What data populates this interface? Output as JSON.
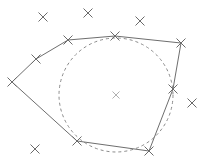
{
  "diagram": {
    "type": "convex-hull-with-enclosing-circle",
    "background": "#ffffff",
    "colors": {
      "hull_stroke": "#6e6e6e",
      "circle_stroke": "#8a8a8a",
      "point_stroke": "#6a6a6a",
      "center_stroke": "#b0b0b0"
    },
    "hull_vertices": [
      [
        12,
        82
      ],
      [
        36,
        59
      ],
      [
        68,
        40
      ],
      [
        115,
        36
      ],
      [
        181,
        43
      ],
      [
        173,
        89
      ],
      [
        149,
        151
      ],
      [
        77,
        141
      ]
    ],
    "other_points": [
      [
        43,
        17
      ],
      [
        88,
        13
      ],
      [
        140,
        21
      ],
      [
        192,
        103
      ],
      [
        35,
        149
      ]
    ],
    "circle": {
      "cx": 116,
      "cy": 95,
      "r": 57,
      "style": "dashed"
    },
    "center_marker": [
      116,
      95
    ]
  }
}
